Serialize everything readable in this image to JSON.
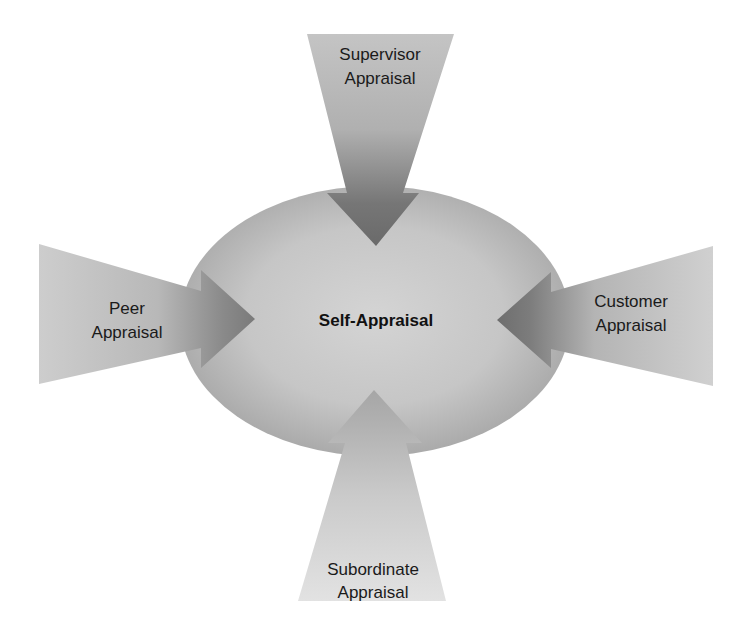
{
  "diagram": {
    "type": "360-degree appraisal diagram",
    "center": {
      "label": "Self-Appraisal",
      "shape": "ellipse",
      "colors": {
        "inner": "#d2d2d2",
        "outer": "#a9a9a9"
      }
    },
    "arrows": [
      {
        "id": "supervisor",
        "direction": "down",
        "line1": "Supervisor",
        "line2": "Appraisal"
      },
      {
        "id": "peer",
        "direction": "right",
        "line1": "Peer",
        "line2": "Appraisal"
      },
      {
        "id": "customer",
        "direction": "left",
        "line1": "Customer",
        "line2": "Appraisal"
      },
      {
        "id": "subordinate",
        "direction": "up",
        "line1": "Subordinate",
        "line2": "Appraisal"
      }
    ],
    "colors": {
      "arrow_light": "#d0d0d0",
      "arrow_dark": "#6e6e6e",
      "background": "#ffffff",
      "text": "#1a1a1a"
    }
  }
}
